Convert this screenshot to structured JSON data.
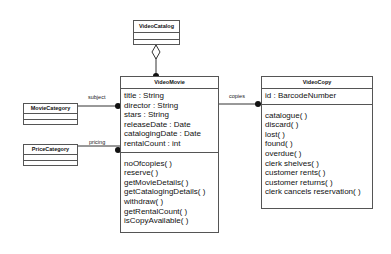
{
  "classes": {
    "video_catalog": {
      "name": "VideoCatalog",
      "attributes": [],
      "operations": []
    },
    "video_movie": {
      "name": "VideoMovie",
      "attributes": [
        "title : String",
        "director : String",
        "stars : String",
        "releaseDate : Date",
        "catalogingDate : Date",
        "rentalCount : int"
      ],
      "operations": [
        "noOfcopies( )",
        "reserve( )",
        "getMovieDetails( )",
        "getCatalogingDetails( )",
        "withdraw( )",
        "getRentalCount( )",
        "isCopyAvailable( )"
      ]
    },
    "video_copy": {
      "name": "VideoCopy",
      "attributes": [
        "id : BarcodeNumber"
      ],
      "operations": [
        "catalogue( )",
        "discard( )",
        "lost( )",
        "found( )",
        "overdue( )",
        "clerk shelves( )",
        "customer rents( )",
        "customer returns( )",
        "clerk cancels reservation( )"
      ]
    },
    "movie_category": {
      "name": "MovieCategory",
      "attributes": [],
      "operations": []
    },
    "price_category": {
      "name": "PriceCategory",
      "attributes": [],
      "operations": []
    }
  },
  "associations": {
    "subject": "subject",
    "pricing": "pricing",
    "copies": "copies"
  }
}
